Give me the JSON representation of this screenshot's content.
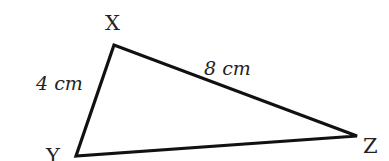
{
  "diagram": {
    "type": "triangle",
    "stroke_color": "#111111",
    "vertices": [
      {
        "name": "X",
        "x": 114,
        "y": 45,
        "label_x": 105,
        "label_y": 30
      },
      {
        "name": "Y",
        "x": 76,
        "y": 156,
        "label_x": 46,
        "label_y": 163
      },
      {
        "name": "Z",
        "x": 357,
        "y": 136,
        "label_x": 363,
        "label_y": 153
      }
    ],
    "sides": [
      {
        "name": "XY",
        "length": "4 cm",
        "label_x": 36,
        "label_y": 90
      },
      {
        "name": "XZ",
        "length": "8 cm",
        "label_x": 204,
        "label_y": 75
      }
    ]
  }
}
